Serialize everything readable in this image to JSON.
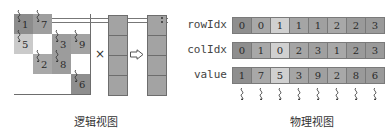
{
  "logical_view": {
    "caption": "逻辑视图",
    "matrix": {
      "rows": 4,
      "cols": 4,
      "entries": [
        {
          "row": 0,
          "col": 0,
          "value": "1",
          "color": "#8c8c8c"
        },
        {
          "row": 0,
          "col": 1,
          "value": "7",
          "color": "#9e9e9e"
        },
        {
          "row": 1,
          "col": 0,
          "value": "5",
          "color": "#cacaca"
        },
        {
          "row": 1,
          "col": 2,
          "value": "3",
          "color": "#9c9c9c"
        },
        {
          "row": 1,
          "col": 3,
          "value": "9",
          "color": "#a2a2a2"
        },
        {
          "row": 2,
          "col": 1,
          "value": "2",
          "color": "#a8a8a8"
        },
        {
          "row": 2,
          "col": 2,
          "value": "8",
          "color": "#9c9c9c"
        },
        {
          "row": 3,
          "col": 3,
          "value": "6",
          "color": "#8e8e8e"
        }
      ]
    },
    "multiply_symbol": "×",
    "arrow_symbol": "⇨",
    "vector_color": "#a3a3a3",
    "result_color": "#a3a3a3"
  },
  "physical_view": {
    "caption": "物理视图",
    "arrays": [
      {
        "label": "rowIdx",
        "values": [
          "0",
          "0",
          "1",
          "1",
          "1",
          "2",
          "2",
          "3"
        ],
        "colors": [
          "#8e8e8e",
          "#a8a8a8",
          "#d0d0d0",
          "#a5a5a5",
          "#a0a0a0",
          "#a8a8a8",
          "#9a9a9a",
          "#9a9a9a"
        ]
      },
      {
        "label": "colIdx",
        "values": [
          "0",
          "1",
          "0",
          "2",
          "3",
          "1",
          "2",
          "3"
        ],
        "colors": [
          "#8e8e8e",
          "#a8a8a8",
          "#d0d0d0",
          "#a5a5a5",
          "#a0a0a0",
          "#a8a8a8",
          "#9a9a9a",
          "#9a9a9a"
        ]
      },
      {
        "label": "value",
        "values": [
          "1",
          "7",
          "5",
          "3",
          "9",
          "2",
          "8",
          "6"
        ],
        "colors": [
          "#8e8e8e",
          "#a8a8a8",
          "#d0d0d0",
          "#a5a5a5",
          "#a0a0a0",
          "#a8a8a8",
          "#9a9a9a",
          "#9a9a9a"
        ]
      }
    ],
    "thread_count": 8
  }
}
